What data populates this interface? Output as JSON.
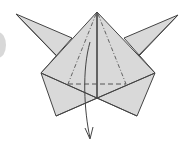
{
  "diagram": {
    "type": "origami-fold-step",
    "colors": {
      "paper": "#d9d9d9",
      "line": "#444444",
      "background": "#ffffff",
      "edge_shade": "#d8d8d8"
    },
    "annotations": {
      "valley_fold_lines": "dash-dot lines from apex",
      "crease_line": "dashed horizontal line",
      "arrow": "curved arrow pointing down (fold down)"
    }
  }
}
